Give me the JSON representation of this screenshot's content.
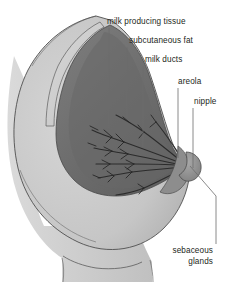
{
  "figure": {
    "background_color": "#ffffff",
    "width": 227,
    "height": 282
  },
  "palette": {
    "background": "#ffffff",
    "skin_light": "#d3d3d3",
    "skin_mid": "#c3c3c3",
    "skin_shadow": "#b4b4b4",
    "torso": "#cfcfcf",
    "fat_band": "#cfcfcf",
    "gland_dark": "#6f6f6f",
    "gland_darker": "#5a5a5a",
    "gland_mid": "#7e7e7e",
    "duct_line": "#2f2f2f",
    "areola": "#8a8a8a",
    "nipple": "#9a9a9a",
    "outline": "#4a4a4a",
    "leader_line": "#6d6d6d",
    "label_text": "#231f20"
  },
  "labels": [
    {
      "id": "milk-producing-tissue",
      "text": "milk  producing tissue",
      "text_x": 107,
      "text_y": 24,
      "anchor": "start",
      "leader": "M 109 28 L 109 128"
    },
    {
      "id": "subcutaneous-fat",
      "text": "subcutaneous fat",
      "text_x": 129,
      "text_y": 43,
      "anchor": "start",
      "leader": "M 127 47 L 127 118"
    },
    {
      "id": "milk-ducts",
      "text": "milk ducts",
      "text_x": 145,
      "text_y": 62,
      "anchor": "start",
      "leader": "M 143 66 L 143 147"
    },
    {
      "id": "areola",
      "text": "areola",
      "text_x": 178,
      "text_y": 84,
      "anchor": "start",
      "leader": "M 178 88 L 178 158"
    },
    {
      "id": "nipple",
      "text": "nipple",
      "text_x": 194,
      "text_y": 104,
      "anchor": "start",
      "leader": "M 193 108 L 193 168"
    },
    {
      "id": "sebaceous-glands",
      "text_line_1": "sebaceous",
      "text_line_2": "glands",
      "text_x": 213,
      "text_y": 253,
      "text_y_2": 264,
      "anchor": "end",
      "leader": "M 190 166 L 216 196 L 216 244"
    }
  ],
  "anatomy": {
    "torso_label": "chest wall and torso",
    "breast_label": "breast outer skin contour",
    "gland_label": "mammary gland mass",
    "fat_label": "subcutaneous fat layer",
    "ducts_label": "lactiferous ducts and lobules",
    "areola_label": "areola region",
    "nipple_label": "nipple"
  }
}
